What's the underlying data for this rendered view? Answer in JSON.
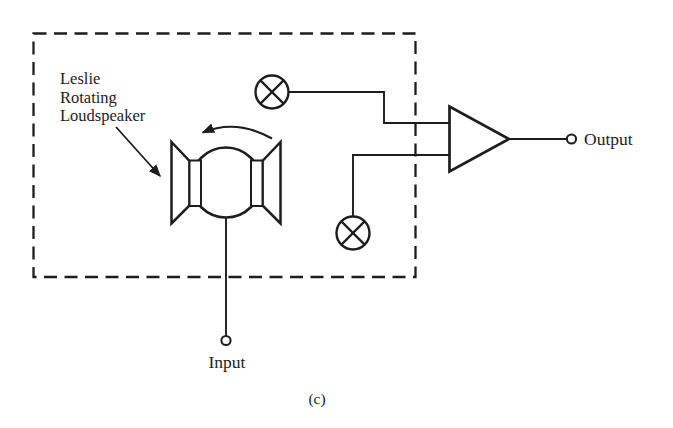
{
  "colors": {
    "background": "#ffffff",
    "ink": "#1d1d1b"
  },
  "annotation": {
    "lines": [
      "Leslie",
      "Rotating",
      "Loudspeaker"
    ]
  },
  "terminals": {
    "input_label": "Input",
    "output_label": "Output"
  },
  "caption": "(c)",
  "symbols": {
    "enclosure": "dashed-boundary-box",
    "loudspeaker": "rotating-horn-loudspeaker",
    "rotation_indicator": "counterclockwise-curved-arrow",
    "microphone_top": "circle-x-microphone",
    "microphone_bottom": "circle-x-microphone",
    "amplifier": "triangle-amplifier",
    "input_terminal": "open-circle-terminal",
    "output_terminal": "open-circle-terminal"
  }
}
